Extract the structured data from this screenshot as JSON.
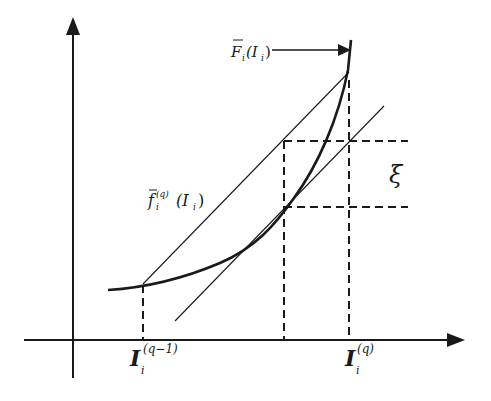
{
  "diagram": {
    "title": "",
    "colors": {
      "ink": "#1a1a1a",
      "background": "#ffffff"
    },
    "axes": {
      "x_axis": {
        "label": "",
        "arrow": true
      },
      "y_axis": {
        "label": "",
        "arrow": true
      }
    },
    "labels": {
      "curve_F_main": "F",
      "curve_F_sub": "i",
      "curve_F_arg": "(I",
      "curve_F_arg_sub": "i",
      "curve_F_close": ")",
      "chord_f_main": "f",
      "chord_f_sub": "i",
      "chord_f_sup": "(q)",
      "chord_f_arg": "(I",
      "chord_f_arg_sub": "i",
      "chord_f_close": ")",
      "xi": "ξ",
      "tick_left_main": "I",
      "tick_left_sub": "i",
      "tick_left_sup": "(q−1)",
      "tick_right_main": "I",
      "tick_right_sub": "i",
      "tick_right_sup": "(q)"
    },
    "elements": {
      "curve": "convex increasing curve F̄_i(I_i)",
      "chord": "secant line f̄_i^(q)(I_i) from I_i^(q−1) to I_i^(q)",
      "tangent": "tangent line parallel to chord",
      "gap_marker": "ξ vertical distance between dashed horizontals"
    }
  }
}
